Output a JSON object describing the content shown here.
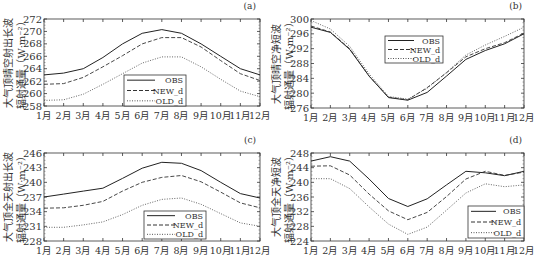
{
  "chart_data": [
    {
      "panel": "(a)",
      "type": "line",
      "ylabel_line1": "大气顶晴空射出长波",
      "ylabel_line2": "辐射通量（W·m⁻²）",
      "xlabel": "",
      "categories": [
        "1月",
        "2月",
        "3月",
        "4月",
        "5月",
        "6月",
        "7月",
        "8月",
        "9月",
        "10月",
        "11月",
        "12月"
      ],
      "ylim": [
        258,
        272
      ],
      "yticks": [
        258,
        260,
        262,
        264,
        266,
        268,
        270,
        272
      ],
      "legend_position": "lower center",
      "series": [
        {
          "name": "OBS",
          "style": "solid",
          "values": [
            263.0,
            263.3,
            264.0,
            265.8,
            268.0,
            269.7,
            270.3,
            269.7,
            268.0,
            266.0,
            264.0,
            263.0
          ]
        },
        {
          "name": "NEW_d",
          "style": "dashed",
          "values": [
            261.5,
            261.6,
            262.6,
            264.3,
            266.1,
            268.0,
            269.0,
            269.0,
            267.5,
            265.3,
            263.2,
            262.1
          ]
        },
        {
          "name": "OLD_d",
          "style": "dotted",
          "values": [
            258.9,
            259.0,
            259.9,
            261.5,
            263.2,
            264.9,
            265.9,
            265.9,
            264.3,
            262.3,
            260.4,
            259.5
          ]
        }
      ]
    },
    {
      "panel": "(b)",
      "type": "line",
      "ylabel_line1": "大气顶晴空净短波",
      "ylabel_line2": "辐射通量（W·m⁻²）",
      "xlabel": "",
      "categories": [
        "1月",
        "2月",
        "3月",
        "4月",
        "5月",
        "6月",
        "7月",
        "8月",
        "9月",
        "10月",
        "11月",
        "12月"
      ],
      "ylim": [
        276,
        300
      ],
      "yticks": [
        276,
        280,
        284,
        288,
        292,
        296,
        300
      ],
      "legend_position": "upper center",
      "series": [
        {
          "name": "OBS",
          "style": "solid",
          "values": [
            297.8,
            296.4,
            291.8,
            284.6,
            278.8,
            278.1,
            280.2,
            284.6,
            289.1,
            291.5,
            293.3,
            296.0
          ]
        },
        {
          "name": "NEW_d",
          "style": "dashed",
          "values": [
            298.1,
            296.5,
            292.0,
            284.6,
            278.9,
            278.2,
            281.5,
            285.5,
            289.8,
            292.0,
            293.6,
            296.2
          ]
        },
        {
          "name": "OLD_d",
          "style": "dotted",
          "values": [
            299.6,
            297.3,
            292.6,
            285.2,
            279.1,
            278.4,
            281.3,
            285.6,
            290.3,
            293.0,
            295.3,
            297.8
          ]
        }
      ]
    },
    {
      "panel": "(c)",
      "type": "line",
      "ylabel_line1": "大气顶全天射出长波",
      "ylabel_line2": "辐射通量（W·m⁻²）",
      "xlabel": "",
      "categories": [
        "1月",
        "2月",
        "3月",
        "4月",
        "5月",
        "6月",
        "7月",
        "8月",
        "9月",
        "10月",
        "11月",
        "12月"
      ],
      "ylim": [
        228,
        246
      ],
      "yticks": [
        228,
        231,
        234,
        237,
        240,
        243,
        246
      ],
      "legend_position": "lower center",
      "series": [
        {
          "name": "OBS",
          "style": "solid",
          "values": [
            237.0,
            237.6,
            238.2,
            238.8,
            240.8,
            242.9,
            244.1,
            243.9,
            242.4,
            240.0,
            237.7,
            236.8
          ]
        },
        {
          "name": "NEW_d",
          "style": "dashed",
          "values": [
            234.7,
            234.8,
            235.3,
            236.1,
            238.2,
            240.0,
            241.0,
            241.4,
            240.1,
            238.0,
            235.8,
            234.8
          ]
        },
        {
          "name": "OLD_d",
          "style": "dotted",
          "values": [
            230.8,
            230.8,
            231.3,
            231.9,
            233.4,
            235.3,
            236.5,
            236.8,
            235.5,
            233.6,
            231.7,
            231.0
          ]
        }
      ]
    },
    {
      "panel": "(d)",
      "type": "line",
      "ylabel_line1": "大气顶全天净短波",
      "ylabel_line2": "辐射通量（W·m⁻²）",
      "xlabel": "",
      "categories": [
        "1月",
        "2月",
        "3月",
        "4月",
        "5月",
        "6月",
        "7月",
        "8月",
        "9月",
        "10月",
        "11月",
        "12月"
      ],
      "ylim": [
        224,
        248
      ],
      "yticks": [
        224,
        228,
        232,
        236,
        240,
        244,
        248
      ],
      "legend_position": "lower right",
      "series": [
        {
          "name": "OBS",
          "style": "solid",
          "values": [
            245.8,
            247.0,
            245.8,
            240.9,
            235.6,
            233.4,
            235.5,
            239.3,
            243.0,
            242.6,
            241.8,
            243.0
          ]
        },
        {
          "name": "NEW_d",
          "style": "dashed",
          "values": [
            244.4,
            244.5,
            242.0,
            236.8,
            232.2,
            229.8,
            231.8,
            236.1,
            240.9,
            243.0,
            241.9,
            242.8
          ]
        },
        {
          "name": "OLD_d",
          "style": "dotted",
          "values": [
            241.0,
            241.0,
            238.3,
            233.3,
            228.6,
            225.8,
            227.8,
            232.4,
            237.1,
            239.6,
            238.8,
            239.3
          ]
        }
      ]
    }
  ],
  "layout": [
    {
      "x0": 44,
      "x1": 260,
      "y0": 19,
      "y1": 106,
      "legend": {
        "x": 124,
        "y": 75,
        "w": 62,
        "h": 31
      },
      "label_x": 256,
      "label_y": 9,
      "ylabel_x": 8
    },
    {
      "x0": 311,
      "x1": 524,
      "y0": 19,
      "y1": 108,
      "legend": {
        "x": 385,
        "y": 36,
        "w": 58,
        "h": 27
      },
      "label_x": 522,
      "label_y": 9,
      "ylabel_x": 276
    },
    {
      "x0": 44,
      "x1": 260,
      "y0": 153,
      "y1": 241,
      "legend": {
        "x": 144,
        "y": 211,
        "w": 62,
        "h": 28
      },
      "label_x": 256,
      "label_y": 143,
      "ylabel_x": 8
    },
    {
      "x0": 311,
      "x1": 524,
      "y0": 153,
      "y1": 241,
      "legend": {
        "x": 468,
        "y": 206,
        "w": 56,
        "h": 32
      },
      "label_x": 522,
      "label_y": 143,
      "ylabel_x": 276
    }
  ]
}
